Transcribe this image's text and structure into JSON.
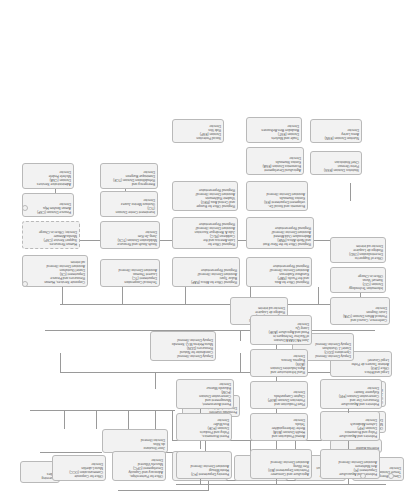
{
  "chart": {
    "type": "org-chart",
    "accent": "#f2f2f2",
    "border": "#b9b9b9",
    "line": "#9a9a9a"
  },
  "nodes": {
    "governing_bodies": {
      "label": "Governing\nBodies",
      "l1": "Governing",
      "l2": "Bodies"
    },
    "director_general": {
      "l1": "Jose Graziano",
      "l2": "da Silva",
      "l3": "Director-General"
    },
    "external_auditor": {
      "l1": "External Auditor"
    },
    "chef_de_cabinet": {
      "l1": "Fernanda Guerrieri",
      "l2": "Director, de Cabinet"
    },
    "ocd": {
      "l1": "Office for Corporate",
      "l2": "Communication (OCC)",
      "l3": "Mario Lubetkin",
      "l4": "Director"
    },
    "opc": {
      "l1": "Office for Partnerships,",
      "l2": "Advocacy and Capacity",
      "l3": "Development (OPC)",
      "l4": "Marcela Villarreal",
      "l5": "Director"
    },
    "osp": {
      "l1": "Office of Strategy,",
      "l2": "Planning and Resources",
      "l3": "Management (OSP)",
      "l4": "Boyd Haight",
      "l5": "Director"
    },
    "ohr": {
      "l1": "Office of Human",
      "l2": "Resources (OHR)",
      "l3": "Monika Altmaier",
      "l4": "Director"
    },
    "spl": {
      "l1": "Land and Water",
      "l2": "Division (SPL)",
      "l3": "Moujahed Achouri",
      "l4": "Director"
    },
    "hrq": {
      "l1": "Climate, Energy and",
      "l2": "Tenure Division (HRQ)",
      "l3": "Director"
    },
    "oed": {
      "l1": "Office of Evaluation (OED)",
      "l2": "Masahiro Igarashi",
      "l3": "Director"
    },
    "oig": {
      "l1": "Office of the Inspector",
      "l2": "General (OIG)",
      "l3": "John Fitzsimon",
      "l4": "Inspector General"
    },
    "leg": {
      "l1": "Legal and Ethics",
      "l2": "Office (LEG)",
      "l3": "Antonio Tavares de Pinho",
      "l4": "Legal Counsel"
    },
    "ddg_nr": {
      "l1": "Deputy Director-General",
      "l2": "Coordinator for Natural",
      "l3": "Resources (DDN)",
      "l4": "Maria Helena M.Q. Semedo",
      "l5": "Deputy Director-General"
    },
    "ddg_op": {
      "l1": "Deputy  Director-General",
      "l2": "Operations  (DDO)",
      "l3": "Daniel J. Gustafson",
      "l4": "Deputy Director-General"
    },
    "ddg_pr": {
      "l1": "Deputy Director-General",
      "l2": "Programmes (DDP)",
      "l3": "Rodrigo de Laquiere",
      "l4": "Director ad interim"
    },
    "cpa": {
      "l1": "Conference, Council and",
      "l2": "Protocol Affairs Division (CPA)",
      "l3": "Louis Gagnon",
      "l4": "Director"
    },
    "cio": {
      "l1": "Information Technology",
      "l2": "Division (CIO)",
      "l3": "Samuel Varas",
      "l4": "Officer-in-Charge"
    },
    "osd": {
      "l1": "Office of Support to",
      "l2": "Decentralization (OSD)",
      "l3": "Rodrigo de Laquiere",
      "l4": "Director ad interim"
    },
    "csh": {
      "l1": "Corporate Services, Human",
      "l2": "Resources and Finance",
      "l3": "Department (CS)",
      "l4": "Daniel Gustafson",
      "l5": "Assistant Director-General",
      "l6": "ad interim"
    },
    "csp": {
      "l1": "Human Resources",
      "l2": "Support Service (CSP)",
      "l3": "Monika Altmaier",
      "l4": "Director, Officer-in-Charge"
    },
    "csf": {
      "l1": "Finance Division (CSF)",
      "l2": "Aiman Ibrahim Hija",
      "l3": "Director"
    },
    "csa": {
      "l1": "Administrative Services",
      "l2": "Division (CSA)",
      "l3": "Michele Fedele",
      "l4": "Director"
    },
    "tc": {
      "l1": "Technical Cooperation",
      "l2": "Department (TC)",
      "l3": "Laurent Thomas",
      "l4": "Assistant Director-General"
    },
    "tcs": {
      "l1": "South-South and Resource",
      "l2": "Mobilization Division (TCS)",
      "l3": "Jong-Jin Kim",
      "l4": "Director"
    },
    "tce": {
      "l1": "Investment Centre Division",
      "l2": "(TCI)",
      "l3": "Gustavo Merino Juarez",
      "l4": "Director"
    },
    "tcd": {
      "l1": "Emergency and",
      "l2": "Rehabilitation Division (TCE)",
      "l3": "Dominique Burgeon",
      "l4": "Director"
    },
    "rafa": {
      "l1": "Regional Office for Africa (RAF)",
      "l2": "Bukar Tijani",
      "l3": "Assistant Director-General/",
      "l4": "Regional Representative"
    },
    "rapa": {
      "l1": "Regional Office for Asia",
      "l2": "and the Pacific (RAP)",
      "l3": "Kundhavi Kadiresan",
      "l4": "Assistant Director-General/",
      "l5": "Regional Representative"
    },
    "rlac": {
      "l1": "Regional Office for",
      "l2": "Latin America and the",
      "l3": "Caribbean (RLC)",
      "l4": "Julio A. Berdegue Sacristan",
      "l5": "Assistant Director-General/",
      "l6": "Regional Representative"
    },
    "rne": {
      "l1": "Regional Office for the Near East",
      "l2": "and North Africa (RNE)",
      "l3": "Abdessalam Ould Ahmed",
      "l4": "Assistant Director-General/",
      "l5": "Regional Representative"
    },
    "reu": {
      "l1": "Regional Office for Europe",
      "l2": "and Central Asia (REU)",
      "l3": "Vladimir Rakhmanin",
      "l4": "Assistant Director-General/",
      "l5": "Regional Representative"
    },
    "es": {
      "l1": "Economic and Social De-",
      "l2": "velopment Department (ES)",
      "l3": "Kostas Stamoulis",
      "l4": "Assistant Director-General"
    },
    "esa": {
      "l1": "Agricultural Development",
      "l2": "Economics Division (ESA)",
      "l3": "Kostas Stamoulis",
      "l4": "Director"
    },
    "ess": {
      "l1": "Statistics Division (ESS)",
      "l2": "Pietro Gennari",
      "l3": "Chief Statistician"
    },
    "est": {
      "l1": "Trade and Markets",
      "l2": "Division (EST)",
      "l3": "Boubaker Ben-Belhassen",
      "l4": "Director"
    },
    "esn": {
      "l1": "Nutrition Division (ESN)",
      "l2": "Anna Lartey",
      "l3": "Director"
    },
    "esp": {
      "l1": "Social Protection",
      "l2": "Division (ESP)",
      "l3": "Rob Vos",
      "l4": "Director"
    },
    "ag": {
      "l1": "Agriculture and Consumer",
      "l2": "Protection Department (AG)",
      "l3": "Ren Wang",
      "l4": "Assistant Director-General"
    },
    "aga": {
      "l1": "Animal Production and",
      "l2": "Health Division (AGA)",
      "l3": "Berhe Gebreegziabher",
      "l4": "Tekola",
      "l5": "Director"
    },
    "agp": {
      "l1": "Plant Production and",
      "l2": "Protection Division (AGP)",
      "l3": "Clayton Campanhola",
      "l4": "Director"
    },
    "ags": {
      "l1": "Rural Infrastructure and",
      "l2": "Agro-Industries Division",
      "l3": "(AGS)",
      "l4": "Eugenia Serova",
      "l5": "Director"
    },
    "agе": {
      "l1": "Joint FAO/IAEA  Division",
      "l2": "of Nuclear Techniques in",
      "l3": "Food and Agriculture (AGE)",
      "l4": "Liang Qu",
      "l5": "Director"
    },
    "fi": {
      "l1": "Fisheries and Aquaculture",
      "l2": "Department (FI)",
      "l3": "Arni Mathiesen",
      "l4": "Assistant Director-General"
    },
    "fip": {
      "l1": "Fisheries and Aquaculture",
      "l2": "Policy and Economics",
      "l3": "Division (FIP)",
      "l4": "Lahsen Ababouch",
      "l5": "Director"
    },
    "fir": {
      "l1": "Fisheries and Aquaculture",
      "l2": "Resources Use and",
      "l3": "Conservation Division (FIR)",
      "l4": "Kolyanne Sowier",
      "l5": "Director"
    },
    "fo": {
      "l1": "Forestry  Department (FO)",
      "l2": "Hiroto Mitsugi",
      "l3": "Assistant Director-General"
    },
    "fop": {
      "l1": "Forest Economics,",
      "l2": "Policy and Products",
      "l3": "Division (FOE)",
      "l4": "Eva Muller",
      "l5": "Director"
    },
    "foa": {
      "l1": "Forest Assessment,",
      "l2": "Management and",
      "l3": "Conservation Division",
      "l4": "(FOM)",
      "l5": "Eduardo Mansur",
      "l6": "Director"
    },
    "esn2": {
      "l1": "Forest Economics,",
      "l2": "Policy and Products",
      "l3": "Division (FOE)",
      "l4": "Eva Muller",
      "l5": "Director"
    }
  }
}
